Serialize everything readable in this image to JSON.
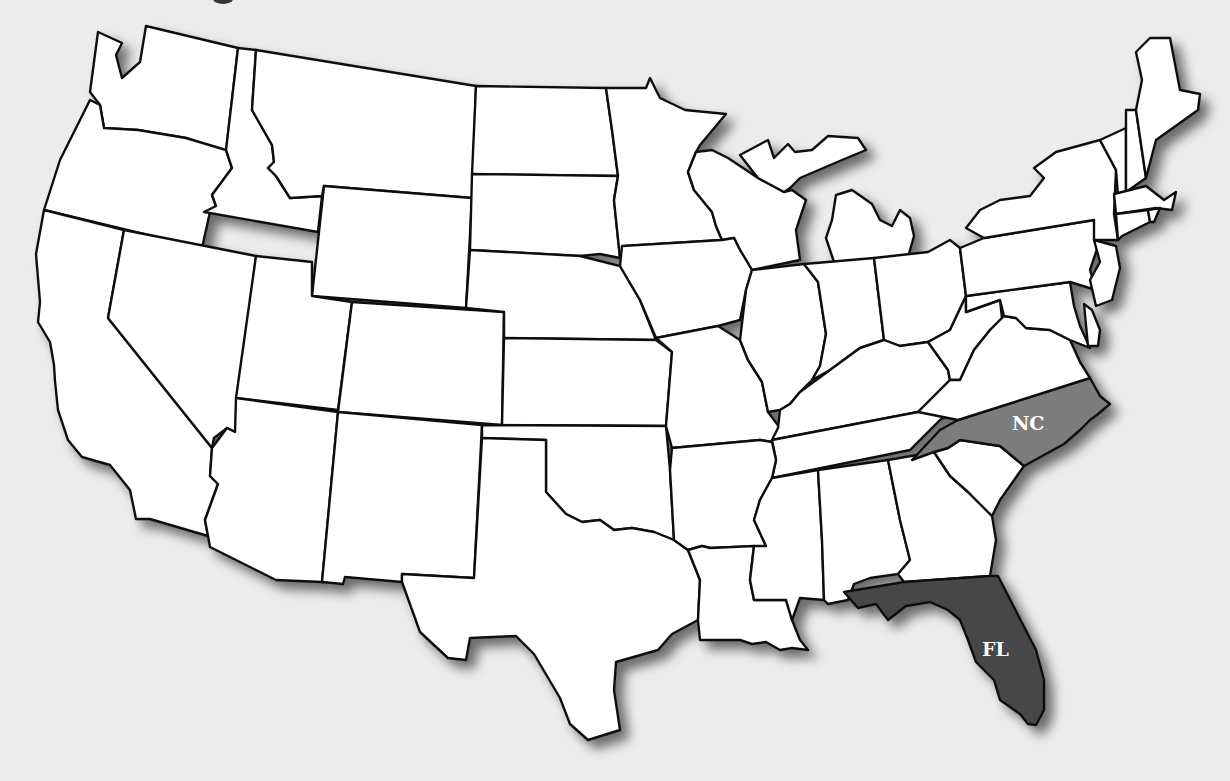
{
  "map": {
    "type": "US states outline map",
    "background_color": "#ececec",
    "default_state_fill": "#ffffff",
    "border_color": "#111111",
    "highlighted_states": [
      {
        "code": "NC",
        "name": "North Carolina",
        "label": "NC",
        "fill": "#7c7c7c"
      },
      {
        "code": "FL",
        "name": "Florida",
        "label": "FL",
        "fill": "#474747"
      }
    ],
    "labels": {
      "nc": "NC",
      "fl": "FL"
    }
  }
}
